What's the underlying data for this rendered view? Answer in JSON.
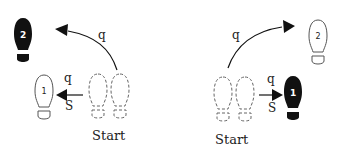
{
  "diagram": {
    "type": "dance-step-footprint-diagram",
    "colors": {
      "ink": "#111111",
      "outline": "#555555",
      "background": "#ffffff"
    },
    "panels": [
      {
        "id": "left",
        "start_label": "Start",
        "start_feet": "two dashed footprints (left & right)",
        "steps": [
          {
            "number": "1",
            "style": "outline",
            "direction": "left",
            "timing_top": "q",
            "timing_bottom": "S"
          },
          {
            "number": "2",
            "style": "filled",
            "direction": "diagonal-back-left (curved)",
            "timing": "q"
          }
        ]
      },
      {
        "id": "right",
        "start_label": "Start",
        "start_feet": "two dashed footprints (left & right)",
        "steps": [
          {
            "number": "1",
            "style": "filled",
            "direction": "right",
            "timing_top": "q",
            "timing_bottom": "S"
          },
          {
            "number": "2",
            "style": "outline",
            "direction": "diagonal-forward-right (curved)",
            "timing": "q"
          }
        ]
      }
    ]
  }
}
